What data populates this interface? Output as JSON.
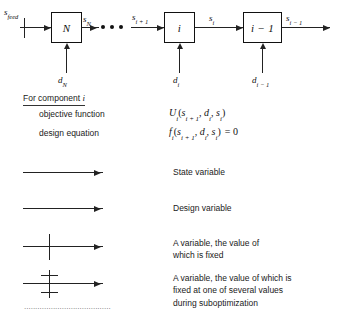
{
  "diagram": {
    "title_label": "Serial process chain",
    "boxes": [
      {
        "id": "box-N",
        "label": "N"
      },
      {
        "id": "box-i",
        "label": "i"
      },
      {
        "id": "box-i-1",
        "label": "i − 1"
      }
    ],
    "stream_labels": {
      "feed": {
        "base": "s",
        "sub": "feed"
      },
      "s_N": {
        "base": "s",
        "sub": "N"
      },
      "s_ip1": {
        "base": "s",
        "sub": "i + 1"
      },
      "s_i": {
        "base": "s",
        "sub": "i"
      },
      "s_im1": {
        "base": "s",
        "sub": "i − 1"
      }
    },
    "design_labels": {
      "d_N": {
        "base": "d",
        "sub": "N"
      },
      "d_i": {
        "base": "d",
        "sub": "i"
      },
      "d_im1": {
        "base": "d",
        "sub": "i − 1"
      }
    },
    "ellipsis_dots": 3
  },
  "component_block": {
    "heading": "For component",
    "heading_symbol": "i",
    "rows": [
      {
        "label": "objective function",
        "expression": "Uᵢ(sᵢ₊₁, dᵢ, sᵢ)"
      },
      {
        "label": "design equation",
        "expression": "fᵢ(sᵢ₊₁, dᵢ, sᵢ) = 0"
      }
    ],
    "objective_function": {
      "func": "U",
      "sub": "i",
      "args": "(s",
      "arg1_sub": "i + 1",
      "arg_mid": ", d",
      "arg2_sub": "i",
      "arg_mid2": ", s",
      "arg3_sub": "i",
      "close": ")"
    },
    "design_equation": {
      "func": "f",
      "sub": "i",
      "close_eq": "= 0"
    }
  },
  "legend": {
    "items": [
      {
        "key": "state-variable",
        "marker": "plain-arrow",
        "ticks": 0,
        "text": "State variable"
      },
      {
        "key": "design-variable",
        "marker": "plain-arrow",
        "ticks": 0,
        "text": "Design variable"
      },
      {
        "key": "fixed-variable",
        "marker": "single-tick-arrow",
        "ticks": 1,
        "text": "A variable, the value of\nwhich is fixed"
      },
      {
        "key": "suboptimization-variable",
        "marker": "double-tick-arrow",
        "ticks": 2,
        "text": "A variable, the value of which is\nfixed at one of several values\nduring suboptimization"
      }
    ]
  },
  "caption": {
    "partial_text": "......................................."
  },
  "colors": {
    "ink": "#1a1a1a",
    "line": "#222222",
    "background": "#ffffff"
  }
}
